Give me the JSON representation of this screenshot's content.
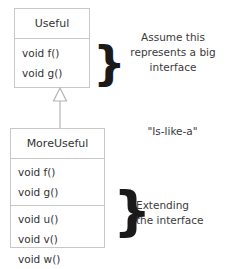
{
  "diagram": {
    "type": "uml-class-diagram",
    "background_color": "#ffffff",
    "border_color": "#c8c8c8",
    "text_color": "#333333",
    "brace_color": "#1a1a1a"
  },
  "classes": [
    {
      "id": "useful",
      "name": "Useful",
      "compartments": [
        {
          "id": "useful-methods",
          "methods": [
            "void f()",
            "void g()"
          ]
        }
      ]
    },
    {
      "id": "moreuseful",
      "name": "MoreUseful",
      "compartments": [
        {
          "id": "moreuseful-inherited",
          "methods": [
            "void f()",
            "void g()"
          ]
        },
        {
          "id": "moreuseful-extended",
          "methods": [
            "void u()",
            "void v()",
            "void w()"
          ]
        }
      ]
    }
  ],
  "relationship": {
    "kind": "generalization",
    "icon": "hollow-triangle-arrow",
    "from": "MoreUseful",
    "to": "Useful",
    "label": "\"Is-like-a\""
  },
  "annotations": {
    "big_interface": "Assume this represents a big interface",
    "big_interface_lines": [
      "Assume this",
      "represents a big",
      "interface"
    ],
    "is_like_a": "\"Is-like-a\"",
    "extending": "Extending the interface",
    "extending_lines": [
      "Extending",
      "the interface"
    ],
    "brace_glyph": "}"
  }
}
